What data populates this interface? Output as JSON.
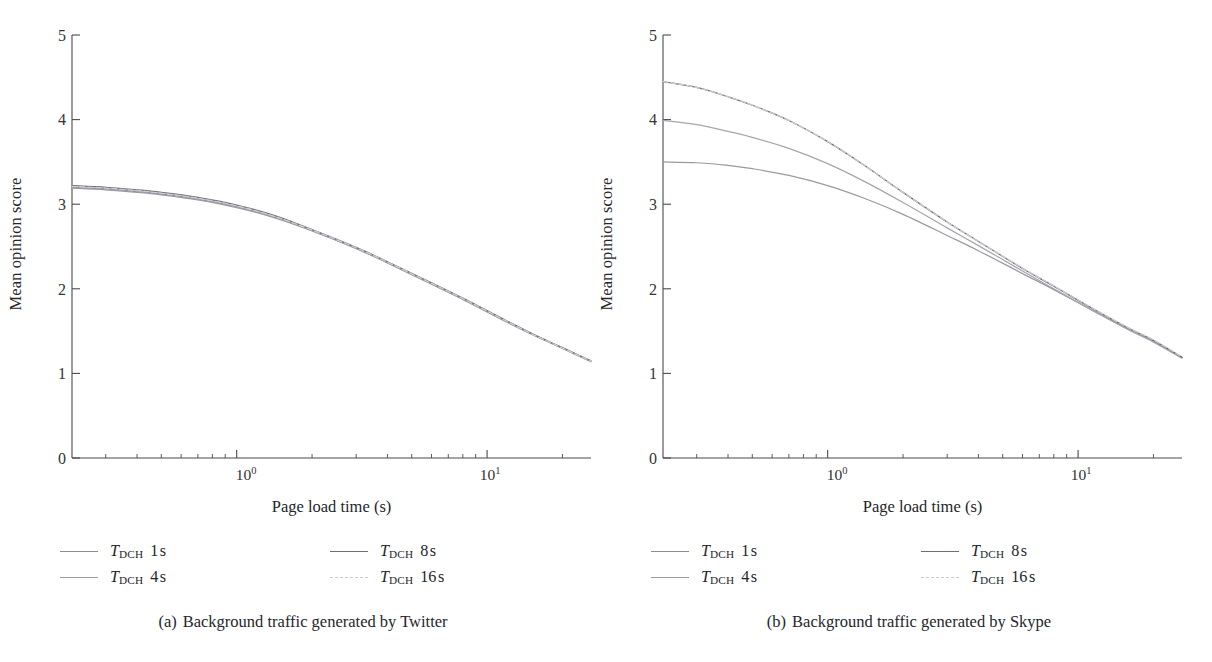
{
  "figure": {
    "background": "#ffffff",
    "width": 1212,
    "height": 662
  },
  "panels": [
    {
      "id": "a",
      "caption_tag": "(a)",
      "caption_text": "Background traffic generated by Twitter"
    },
    {
      "id": "b",
      "caption_tag": "(b)",
      "caption_text": "Background traffic generated by Skype"
    }
  ],
  "axis": {
    "ylabel": "Mean opinion score",
    "xlabel": "Page load time (s)",
    "yticks": [
      "0",
      "1",
      "2",
      "3",
      "4",
      "5"
    ],
    "xticks": [
      {
        "mantissa": "10",
        "exponent": "0"
      },
      {
        "mantissa": "10",
        "exponent": "1"
      }
    ]
  },
  "legend": {
    "symbol": "T",
    "subscript": "DCH",
    "entries": [
      {
        "value": "1",
        "unit": "s",
        "color": "#8c8c94",
        "dash": "solid"
      },
      {
        "value": "4",
        "unit": "s",
        "color": "#9a9aa2",
        "dash": "solid"
      },
      {
        "value": "8",
        "unit": "s",
        "color": "#6d6d76",
        "dash": "solid"
      },
      {
        "value": "16",
        "unit": "s",
        "color": "#c9c9cf",
        "dash": "dashed"
      }
    ]
  },
  "chart_data": [
    {
      "type": "line",
      "title": "(a) Background traffic generated by Twitter",
      "xlabel": "Page load time (s)",
      "ylabel": "Mean opinion score",
      "xscale": "log",
      "xlim": [
        0.22,
        26
      ],
      "ylim": [
        0,
        5
      ],
      "grid": false,
      "legend_position": "below-plot",
      "x": [
        0.22,
        0.3,
        0.4,
        0.5,
        0.7,
        1.0,
        1.4,
        2.0,
        3.0,
        4.0,
        6.0,
        8.0,
        12.0,
        16.0,
        20.0,
        26.0
      ],
      "series": [
        {
          "name": "T_DCH 1 s",
          "color": "#8c8c94",
          "values": [
            3.2,
            3.18,
            3.15,
            3.12,
            3.06,
            2.97,
            2.85,
            2.69,
            2.48,
            2.31,
            2.06,
            1.88,
            1.61,
            1.43,
            1.3,
            1.14
          ]
        },
        {
          "name": "T_DCH 4 s",
          "color": "#9a9aa2",
          "values": [
            3.19,
            3.17,
            3.14,
            3.11,
            3.05,
            2.96,
            2.845,
            2.685,
            2.475,
            2.305,
            2.055,
            1.875,
            1.605,
            1.425,
            1.295,
            1.14
          ]
        },
        {
          "name": "T_DCH 8 s",
          "color": "#6d6d76",
          "values": [
            3.22,
            3.2,
            3.17,
            3.14,
            3.08,
            2.99,
            2.87,
            2.7,
            2.49,
            2.32,
            2.07,
            1.89,
            1.62,
            1.435,
            1.305,
            1.15
          ]
        },
        {
          "name": "T_DCH 16 s",
          "color": "#c9c9cf",
          "values": [
            3.21,
            3.19,
            3.16,
            3.13,
            3.07,
            2.98,
            2.86,
            2.695,
            2.485,
            2.315,
            2.065,
            1.885,
            1.615,
            1.43,
            1.3,
            1.145
          ]
        }
      ]
    },
    {
      "type": "line",
      "title": "(b) Background traffic generated by Skype",
      "xlabel": "Page load time (s)",
      "ylabel": "Mean opinion score",
      "xscale": "log",
      "xlim": [
        0.22,
        26
      ],
      "ylim": [
        0,
        5
      ],
      "grid": false,
      "legend_position": "below-plot",
      "x": [
        0.22,
        0.3,
        0.4,
        0.5,
        0.7,
        1.0,
        1.4,
        2.0,
        3.0,
        4.0,
        6.0,
        8.0,
        12.0,
        16.0,
        20.0,
        26.0
      ],
      "series": [
        {
          "name": "T_DCH 1 s",
          "color": "#9a9aa2",
          "values": [
            3.5,
            3.49,
            3.46,
            3.42,
            3.34,
            3.22,
            3.07,
            2.88,
            2.63,
            2.45,
            2.18,
            1.99,
            1.71,
            1.52,
            1.38,
            1.19
          ]
        },
        {
          "name": "T_DCH 4 s",
          "color": "#a5a5ad",
          "values": [
            3.99,
            3.94,
            3.86,
            3.79,
            3.66,
            3.48,
            3.27,
            3.02,
            2.72,
            2.51,
            2.21,
            2.0,
            1.71,
            1.51,
            1.37,
            1.18
          ]
        },
        {
          "name": "T_DCH 8 s",
          "color": "#6d6d76",
          "values": [
            4.45,
            4.38,
            4.27,
            4.17,
            3.99,
            3.74,
            3.46,
            3.14,
            2.79,
            2.56,
            2.24,
            2.03,
            1.73,
            1.53,
            1.39,
            1.19
          ]
        },
        {
          "name": "T_DCH 16 s",
          "color": "#c9c9cf",
          "values": [
            4.45,
            4.38,
            4.27,
            4.17,
            3.99,
            3.74,
            3.46,
            3.14,
            2.79,
            2.56,
            2.245,
            2.035,
            1.735,
            1.535,
            1.395,
            1.195
          ]
        }
      ]
    }
  ]
}
